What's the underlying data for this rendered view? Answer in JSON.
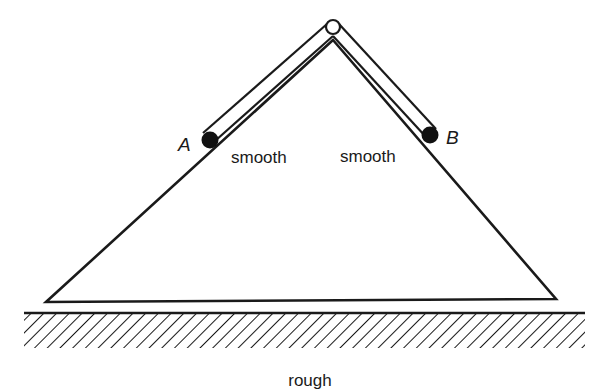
{
  "figure": {
    "type": "mechanics-diagram",
    "labels": {
      "bead_a": "A",
      "bead_b": "B",
      "left_face": "smooth",
      "right_face": "smooth",
      "ground": "rough"
    },
    "colors": {
      "ink": "#1a1a1a",
      "background": "#ffffff",
      "hinge_fill": "#ffffff"
    },
    "geometry": {
      "hinge": {
        "cx": 333,
        "cy": 27,
        "r": 7
      },
      "wedge": {
        "apex": [
          333,
          40
        ],
        "bottom_left": [
          46,
          302
        ],
        "bottom_right": [
          556,
          299
        ]
      },
      "bead_a": {
        "cx": 210,
        "cy": 140,
        "r": 8
      },
      "bead_b": {
        "cx": 430,
        "cy": 135,
        "r": 8
      },
      "ground": {
        "x1": 24,
        "x2": 585,
        "y": 313,
        "hatch_depth": 34
      }
    }
  }
}
